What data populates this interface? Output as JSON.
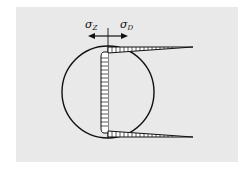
{
  "diagram": {
    "labels": {
      "left_symbol": "σ",
      "left_subscript": "Z",
      "right_symbol": "σ",
      "right_subscript": "D"
    },
    "elements": [
      "circle cross-section",
      "vertical reference axis",
      "left arrow (tension σZ)",
      "right arrow (compression σD)",
      "hatched vertical stress band inside circle",
      "top tapered hatched stress spike extending right",
      "bottom tapered hatched stress spike extending right"
    ],
    "colors": {
      "background": "#e9e9e9",
      "stroke": "#111111"
    }
  }
}
